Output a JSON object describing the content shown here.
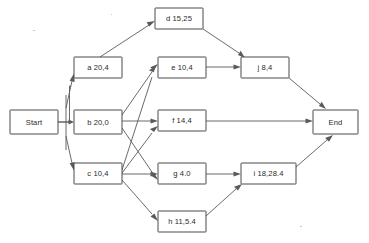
{
  "diagram": {
    "type": "activity-on-node-network",
    "canvas": {
      "width": 369,
      "height": 243
    },
    "colors": {
      "background": "#ffffff",
      "node_stroke": "#4a4a4a",
      "node_fill": "#ffffff",
      "edge_stroke": "#5a5a5a",
      "text": "#2b2b2b"
    },
    "nodes": [
      {
        "id": "start",
        "label": "Start",
        "x": 10,
        "y": 110,
        "w": 48,
        "h": 24
      },
      {
        "id": "a",
        "label": "a 20,4",
        "x": 74,
        "y": 57,
        "w": 48,
        "h": 21
      },
      {
        "id": "b",
        "label": "b 20,0",
        "x": 74,
        "y": 110,
        "w": 48,
        "h": 24
      },
      {
        "id": "c",
        "label": "c 10,4",
        "x": 74,
        "y": 163,
        "w": 48,
        "h": 21
      },
      {
        "id": "d",
        "label": "d 15,25",
        "x": 155,
        "y": 8,
        "w": 48,
        "h": 21
      },
      {
        "id": "e",
        "label": "e 10,4",
        "x": 158,
        "y": 57,
        "w": 48,
        "h": 21
      },
      {
        "id": "f",
        "label": "f 14,4",
        "x": 158,
        "y": 110,
        "w": 48,
        "h": 21
      },
      {
        "id": "g",
        "label": "g 4.0",
        "x": 158,
        "y": 163,
        "w": 48,
        "h": 21
      },
      {
        "id": "h",
        "label": "h 11,5.4",
        "x": 158,
        "y": 211,
        "w": 48,
        "h": 21
      },
      {
        "id": "i",
        "label": "i 18,28.4",
        "x": 241,
        "y": 163,
        "w": 55,
        "h": 21
      },
      {
        "id": "j",
        "label": "j 8,4",
        "x": 241,
        "y": 57,
        "w": 48,
        "h": 21
      },
      {
        "id": "end",
        "label": "End",
        "x": 313,
        "y": 110,
        "w": 45,
        "h": 24
      }
    ],
    "edges": [
      {
        "id": "start-a",
        "from": "start",
        "to": "a"
      },
      {
        "id": "start-b",
        "from": "start",
        "to": "b"
      },
      {
        "id": "start-c",
        "from": "start",
        "to": "c"
      },
      {
        "id": "a-d",
        "from": "a",
        "to": "d"
      },
      {
        "id": "b-e",
        "from": "b",
        "to": "e"
      },
      {
        "id": "b-f",
        "from": "b",
        "to": "f"
      },
      {
        "id": "b-g",
        "from": "b",
        "to": "g"
      },
      {
        "id": "c-e",
        "from": "c",
        "to": "e"
      },
      {
        "id": "c-f",
        "from": "c",
        "to": "f"
      },
      {
        "id": "c-g",
        "from": "c",
        "to": "g"
      },
      {
        "id": "c-h",
        "from": "c",
        "to": "h"
      },
      {
        "id": "d-j",
        "from": "d",
        "to": "j"
      },
      {
        "id": "e-j",
        "from": "e",
        "to": "j"
      },
      {
        "id": "f-end",
        "from": "f",
        "to": "end"
      },
      {
        "id": "g-i",
        "from": "g",
        "to": "i"
      },
      {
        "id": "h-i",
        "from": "h",
        "to": "i"
      },
      {
        "id": "i-end",
        "from": "i",
        "to": "end"
      },
      {
        "id": "j-end",
        "from": "j",
        "to": "end"
      }
    ]
  }
}
